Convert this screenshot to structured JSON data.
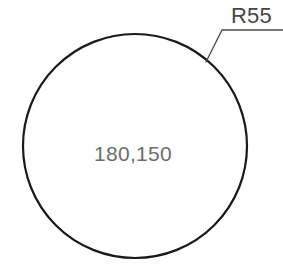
{
  "drawing": {
    "type": "engineering-drawing",
    "background_color": "#ffffff",
    "line_color": "#1a1a1a",
    "circle": {
      "name": "circle-outline",
      "center_x": 135,
      "center_y": 146,
      "radius_px": 112,
      "stroke_width": 2.2,
      "fill": "none"
    },
    "leader": {
      "name": "leader-line",
      "stroke_width": 1.3,
      "color": "#4a4a4a",
      "arrow_point_x": 206,
      "arrow_point_y": 62,
      "elbow_x": 222,
      "elbow_y": 30,
      "landing_end_x": 283,
      "landing_end_y": 30
    },
    "labels": {
      "radius": {
        "text": "R55",
        "color": "#464646",
        "font_size": 22
      },
      "center_coordinate": {
        "text": "180,150",
        "color": "#6d6d6d",
        "font_size": 21
      }
    }
  }
}
